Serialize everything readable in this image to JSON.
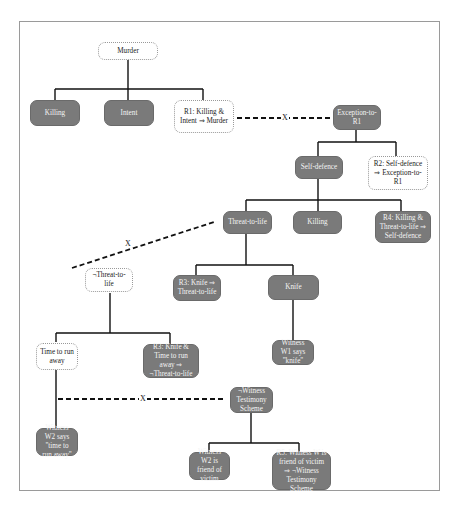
{
  "diagram": {
    "nodes": {
      "murder": {
        "label": "Murder",
        "style": "light"
      },
      "killing1": {
        "label": "Killing",
        "style": "dark"
      },
      "intent": {
        "label": "Intent",
        "style": "dark"
      },
      "r1": {
        "label": "R1: Killing & Intent ⇒ Murder",
        "style": "light"
      },
      "exception_r1": {
        "label": "Exception-to-R1",
        "style": "dark"
      },
      "self_defence": {
        "label": "Self-defence",
        "style": "dark"
      },
      "r2": {
        "label": "R2: Self-defence ⇒ Exception-to-R1",
        "style": "light"
      },
      "threat_to_life": {
        "label": "Threat-to-life",
        "style": "dark"
      },
      "killing2": {
        "label": "Killing",
        "style": "dark"
      },
      "r4": {
        "label": "R4: Killing & Threat-to-life ⇒ Self-defence",
        "style": "dark"
      },
      "not_threat_to_life": {
        "label": "¬Threat-to-life",
        "style": "light"
      },
      "r3a": {
        "label": "R3: Knife ⇒ Threat-to-life",
        "style": "dark"
      },
      "knife": {
        "label": "Knife",
        "style": "dark"
      },
      "witness_w1": {
        "label": "Witness W1 says \"knife\"",
        "style": "dark"
      },
      "time_to_run": {
        "label": "Time to run away",
        "style": "light"
      },
      "r3b": {
        "label": "R3: Knife & Time to run away ⇒ ¬Threat-to-life",
        "style": "dark"
      },
      "not_witness_scheme": {
        "label": "¬Witness Testimony Scheme",
        "style": "dark"
      },
      "witness_w2": {
        "label": "Witness W2 says \"time to run away\"",
        "style": "dark"
      },
      "w2_friend": {
        "label": "Witness W2 is friend of victim",
        "style": "dark"
      },
      "r5": {
        "label": "R5: Witness W is friend of victim ⇒ ¬Witness Testimony Scheme",
        "style": "dark"
      }
    },
    "attack_marker": "X"
  }
}
